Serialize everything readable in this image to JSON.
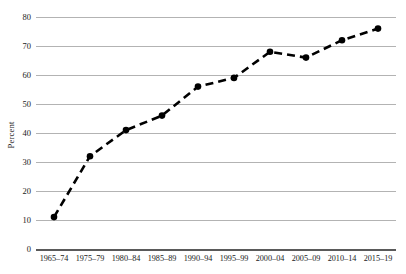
{
  "chart_data": {
    "type": "line",
    "title": "",
    "subtitle": "",
    "xlabel": "",
    "ylabel": "Percent",
    "categories": [
      "1965–74",
      "1975–79",
      "1980–84",
      "1985–89",
      "1990–94",
      "1995–99",
      "2000–04",
      "2005–09",
      "2010–14",
      "2015–19"
    ],
    "values": [
      11,
      32,
      41,
      46,
      56,
      59,
      68,
      66,
      72,
      76
    ],
    "ylim": [
      0,
      80
    ],
    "ytick_values": [
      0,
      10,
      20,
      30,
      40,
      50,
      60,
      70,
      80
    ],
    "ytick_labels": [
      "0",
      "10",
      "20",
      "30",
      "40",
      "50",
      "60",
      "70",
      "80"
    ],
    "grid": true,
    "grid_axis": "y",
    "legend": false,
    "legend_position": "none",
    "annotations": [],
    "series": [
      {
        "name": "Percent",
        "values": [
          11,
          32,
          41,
          46,
          56,
          59,
          68,
          66,
          72,
          76
        ],
        "line_style": "dashed",
        "line_color": "#000000",
        "marker": "circle",
        "marker_color": "#000000"
      }
    ]
  },
  "style": {
    "background": "#ffffff",
    "gridline_color": "#b3b3b3",
    "axis_color": "#5a5a5a",
    "text_color": "#1a1a1a"
  }
}
